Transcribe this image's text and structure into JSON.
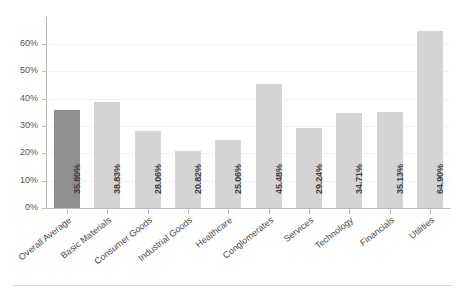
{
  "chart_data": {
    "type": "bar",
    "title": "",
    "subtitle": "",
    "xlabel": "",
    "ylabel": "",
    "ylim": [
      0,
      69.9
    ],
    "grid": true,
    "legend": "none",
    "y_ticks": [
      "0%",
      "10%",
      "20%",
      "30%",
      "40%",
      "50%",
      "60%"
    ],
    "y_tick_values": [
      0,
      10,
      20,
      30,
      40,
      50,
      60
    ],
    "value_suffix": "%",
    "categories": [
      "Overall Average",
      "Basic Materials",
      "Consumer Goods",
      "Industrial Goods",
      "Healthcare",
      "Conglomerates",
      "Services",
      "Technology",
      "Financials",
      "Utilities"
    ],
    "values": [
      35.8,
      38.83,
      28.06,
      20.82,
      25.06,
      45.48,
      29.24,
      34.71,
      35.13,
      64.9
    ],
    "value_labels": [
      "35.80%",
      "38.83%",
      "28.06%",
      "20.82%",
      "25.06%",
      "45.48%",
      "29.24%",
      "34.71%",
      "35.13%",
      "64.90%"
    ],
    "highlight_index": 0,
    "colors": {
      "bar": "#d4d4d4",
      "bar_highlight": "#8f8f8f",
      "axis": "#bbbbbb",
      "gridline": "#e9e9e9",
      "tick_text": "#555555",
      "value_text": "#3d3d3d",
      "category_text": "#4a4a4a",
      "rule": "#d9d9d9",
      "background": "#ffffff"
    }
  }
}
